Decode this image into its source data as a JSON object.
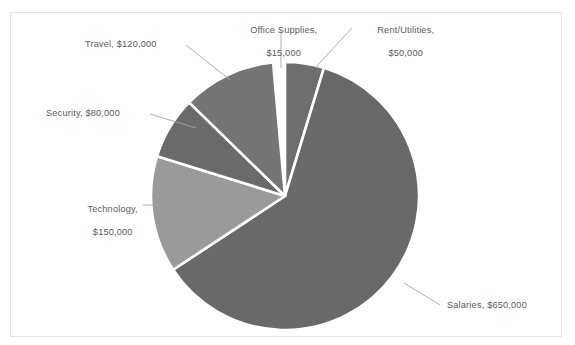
{
  "chart_data": {
    "type": "pie",
    "title": "",
    "categories": [
      "Rent/Utilities",
      "Salaries",
      "Technology",
      "Security",
      "Travel",
      "Office Supplies"
    ],
    "values": [
      50000,
      650000,
      150000,
      80000,
      120000,
      15000
    ],
    "total": 1065000,
    "value_prefix": "$",
    "legend": "none",
    "data_labels_position": "outside-with-leader-lines",
    "start_angle_deg": 0,
    "direction": "clockwise",
    "slices": [
      {
        "name": "Office Supplies",
        "value": 15000,
        "label": "Office Supplies,\n$15,000",
        "percent": 1.4,
        "color": "#808080",
        "start_deg": 338.3,
        "sweep_deg": 5.1
      },
      {
        "name": "Rent/Utilities",
        "value": 50000,
        "label": "Rent/Utilities,\n$50,000",
        "percent": 4.7,
        "color": "#6e6e6e",
        "start_deg": 0.0,
        "sweep_deg": 16.9
      },
      {
        "name": "Salaries",
        "value": 650000,
        "label": "Salaries, $650,000",
        "percent": 61.0,
        "color": "#696969",
        "start_deg": 16.9,
        "sweep_deg": 219.7
      },
      {
        "name": "Technology",
        "value": 150000,
        "label": "Technology,\n$150,000",
        "percent": 14.1,
        "color": "#9a9a9a",
        "start_deg": 236.6,
        "sweep_deg": 50.7
      },
      {
        "name": "Security",
        "value": 80000,
        "label": "Security, $80,000",
        "percent": 7.5,
        "color": "#6a6a6a",
        "start_deg": 287.3,
        "sweep_deg": 27.0
      },
      {
        "name": "Travel",
        "value": 120000,
        "label": "Travel, $120,000",
        "percent": 11.3,
        "color": "#757575",
        "start_deg": 314.3,
        "sweep_deg": 40.6
      }
    ],
    "geometry": {
      "cx": 285,
      "cy": 196,
      "r": 134
    },
    "style": {
      "slice_gap_color": "#ffffff",
      "leader_line_color": "#a6a6a6",
      "plot_border_color": "#e3e3e3",
      "label_text_color": "#595959"
    }
  },
  "labels": {
    "office_supplies_l1": "Office Supplies,",
    "office_supplies_l2": "$15,000",
    "rent_utilities_l1": "Rent/Utilities,",
    "rent_utilities_l2": "$50,000",
    "travel": "Travel, $120,000",
    "security": "Security, $80,000",
    "technology_l1": "Technology,",
    "technology_l2": "$150,000",
    "salaries": "Salaries, $650,000"
  }
}
